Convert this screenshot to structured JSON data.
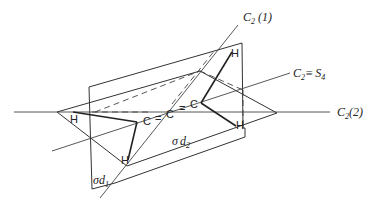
{
  "figure": {
    "atoms": {
      "c_chain": [
        "C",
        "=",
        "C",
        "=",
        "C"
      ],
      "h_labels": [
        "H",
        "H",
        "H",
        "H"
      ]
    },
    "axes": {
      "c2_1": {
        "symbol": "C",
        "sub": "2",
        "suffix": "(1)"
      },
      "c2_s4": {
        "symbol": "C",
        "sub": "2",
        "eq": "≡",
        "s_symbol": "S",
        "s_sub": "4"
      },
      "c2_2": {
        "symbol": "C",
        "sub": "2",
        "suffix": "(2)"
      }
    },
    "planes": {
      "sigma_d1": {
        "sigma": "σ",
        "d": "d",
        "sub": "1"
      },
      "sigma_d2": {
        "sigma": "σ",
        "d": "d",
        "sub": "2"
      }
    }
  }
}
